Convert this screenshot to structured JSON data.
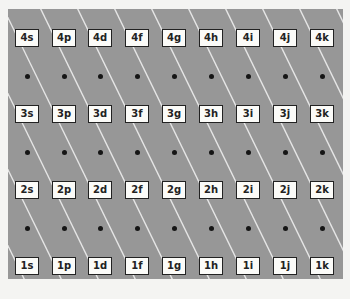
{
  "diagram": {
    "title": "",
    "background_color": "#979797",
    "line_color": "#e8e8e8",
    "rows": [
      {
        "n": "4",
        "cells": [
          "4s",
          "4p",
          "4d",
          "4f",
          "4g",
          "4h",
          "4i",
          "4j",
          "4k"
        ]
      },
      {
        "n": "3",
        "cells": [
          "3s",
          "3p",
          "3d",
          "3f",
          "3g",
          "3h",
          "3i",
          "3j",
          "3k"
        ]
      },
      {
        "n": "2",
        "cells": [
          "2s",
          "2p",
          "2d",
          "2f",
          "2g",
          "2h",
          "2i",
          "2j",
          "2k"
        ]
      },
      {
        "n": "1",
        "cells": [
          "1s",
          "1p",
          "1d",
          "1f",
          "1g",
          "1h",
          "1i",
          "1j",
          "1k"
        ]
      }
    ],
    "dot_rows": 3,
    "dots_per_row": 9
  }
}
